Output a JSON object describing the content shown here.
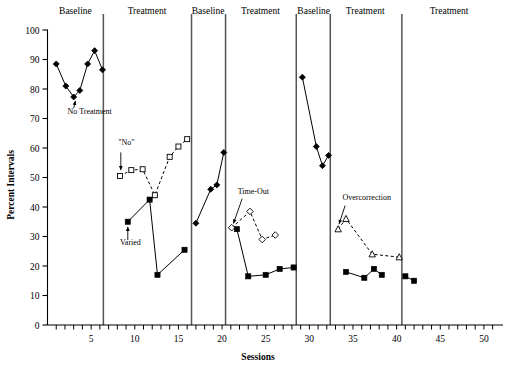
{
  "chart_data": {
    "type": "line",
    "title": "",
    "xlabel": "Sessions",
    "ylabel": "Percent Intervals",
    "xlim": [
      0,
      51.5
    ],
    "ylim": [
      0,
      100
    ],
    "grid": false,
    "legend_position": "none",
    "xticks": [
      0,
      1,
      2,
      3,
      4,
      5,
      6,
      7,
      8,
      9,
      10,
      11,
      12,
      13,
      14,
      15,
      16,
      17,
      18,
      19,
      20,
      21,
      22,
      23,
      24,
      25,
      26,
      27,
      28,
      29,
      30,
      31,
      32,
      33,
      34,
      35,
      36,
      37,
      38,
      39,
      40,
      41,
      42,
      43,
      44,
      45,
      46,
      47,
      48,
      49,
      50,
      51
    ],
    "xtick_labels": [
      {
        "v": 5,
        "text": "5"
      },
      {
        "v": 10,
        "text": "10"
      },
      {
        "v": 15,
        "text": "15"
      },
      {
        "v": 20,
        "text": "20"
      },
      {
        "v": 25,
        "text": "25"
      },
      {
        "v": 30,
        "text": "30"
      },
      {
        "v": 35,
        "text": "35"
      },
      {
        "v": 40,
        "text": "40"
      },
      {
        "v": 45,
        "text": "45"
      },
      {
        "v": 50,
        "text": "50"
      }
    ],
    "yticks": [
      0,
      10,
      20,
      30,
      40,
      50,
      60,
      70,
      80,
      90,
      100
    ],
    "ytick_labels": [
      "0",
      "10",
      "20",
      "30",
      "40",
      "50",
      "60",
      "70",
      "80",
      "90",
      "100"
    ],
    "phase_dividers": [
      6.4,
      16.5,
      20.4,
      28.5,
      32.4,
      40.6
    ],
    "phase_labels": [
      {
        "text": "Baseline",
        "x": 3.2
      },
      {
        "text": "Treatment",
        "x": 11.4
      },
      {
        "text": "Baseline",
        "x": 18.4
      },
      {
        "text": "Treatment",
        "x": 24.4
      },
      {
        "text": "Baseline",
        "x": 30.5
      },
      {
        "text": "Treatment",
        "x": 36.4
      },
      {
        "text": "Treatment",
        "x": 46.0
      }
    ],
    "series": [
      {
        "name": "No Treatment",
        "marker": "filled-diamond",
        "linestyle": "solid",
        "color": "#000000",
        "points": [
          {
            "x": 1.0,
            "y": 88.5
          },
          {
            "x": 2.1,
            "y": 81.0
          },
          {
            "x": 3.0,
            "y": 77.3
          },
          {
            "x": 3.7,
            "y": 79.5
          },
          {
            "x": 4.6,
            "y": 88.5
          },
          {
            "x": 5.4,
            "y": 93.0
          },
          {
            "x": 6.3,
            "y": 86.5
          }
        ]
      },
      {
        "name": "\"No\"",
        "marker": "open-square",
        "linestyle": "dashed",
        "color": "#000000",
        "points": [
          {
            "x": 8.3,
            "y": 50.5
          },
          {
            "x": 9.6,
            "y": 52.5
          },
          {
            "x": 10.9,
            "y": 52.8
          },
          {
            "x": 12.3,
            "y": 44.0
          },
          {
            "x": 14.0,
            "y": 57.0
          },
          {
            "x": 15.0,
            "y": 60.5
          },
          {
            "x": 16.0,
            "y": 63.0
          }
        ]
      },
      {
        "name": "Varied",
        "marker": "filled-square",
        "linestyle": "solid",
        "color": "#000000",
        "points": [
          {
            "x": 9.2,
            "y": 35.0
          },
          {
            "x": 11.7,
            "y": 42.5
          },
          {
            "x": 12.6,
            "y": 17.0
          },
          {
            "x": 15.7,
            "y": 25.5
          }
        ]
      },
      {
        "name": "Baseline 2",
        "marker": "filled-diamond",
        "linestyle": "solid",
        "color": "#000000",
        "points": [
          {
            "x": 17.0,
            "y": 34.5
          },
          {
            "x": 18.7,
            "y": 46.0
          },
          {
            "x": 19.4,
            "y": 47.5
          },
          {
            "x": 20.2,
            "y": 58.5
          }
        ]
      },
      {
        "name": "Time-Out",
        "marker": "open-diamond",
        "linestyle": "dashed",
        "color": "#000000",
        "points": [
          {
            "x": 21.1,
            "y": 33.0
          },
          {
            "x": 23.2,
            "y": 38.5
          },
          {
            "x": 24.6,
            "y": 29.0
          },
          {
            "x": 26.1,
            "y": 30.5
          }
        ]
      },
      {
        "name": "Time-Out responding",
        "marker": "filled-square",
        "linestyle": "solid",
        "color": "#000000",
        "points": [
          {
            "x": 21.7,
            "y": 32.5
          },
          {
            "x": 23.0,
            "y": 16.5
          },
          {
            "x": 25.0,
            "y": 17.0
          },
          {
            "x": 26.6,
            "y": 19.0
          },
          {
            "x": 28.2,
            "y": 19.5
          }
        ]
      },
      {
        "name": "Baseline 3",
        "marker": "filled-diamond",
        "linestyle": "solid",
        "color": "#000000",
        "points": [
          {
            "x": 29.2,
            "y": 84.0
          },
          {
            "x": 30.8,
            "y": 60.5
          },
          {
            "x": 31.5,
            "y": 54.0
          },
          {
            "x": 32.2,
            "y": 57.5
          }
        ]
      },
      {
        "name": "Overcorrection",
        "marker": "open-triangle",
        "linestyle": "dashed",
        "color": "#000000",
        "points": [
          {
            "x": 33.3,
            "y": 32.5
          },
          {
            "x": 34.2,
            "y": 36.0
          },
          {
            "x": 37.2,
            "y": 24.0
          },
          {
            "x": 40.3,
            "y": 23.0
          }
        ]
      },
      {
        "name": "Overcorrection responding",
        "marker": "filled-square",
        "linestyle": "solid",
        "color": "#000000",
        "points": [
          {
            "x": 34.2,
            "y": 18.0
          },
          {
            "x": 36.3,
            "y": 16.0
          },
          {
            "x": 37.4,
            "y": 19.0
          },
          {
            "x": 38.3,
            "y": 17.0
          }
        ]
      },
      {
        "name": "Final treatment",
        "marker": "filled-square",
        "linestyle": "solid",
        "color": "#000000",
        "points": [
          {
            "x": 41.0,
            "y": 16.5
          },
          {
            "x": 42.0,
            "y": 15.0
          }
        ]
      }
    ],
    "annotations": [
      {
        "text": "No Treatment",
        "text_x": 2.3,
        "text_y": 71.5,
        "anchor": "start",
        "arrow": {
          "x1": 3.0,
          "y1": 73.5,
          "x2": 3.2,
          "y2": 76.0
        }
      },
      {
        "text": "\"No\"",
        "text_x": 8.1,
        "text_y": 61.0,
        "anchor": "start",
        "arrow": {
          "x1": 8.4,
          "y1": 58.5,
          "x2": 8.4,
          "y2": 52.5
        }
      },
      {
        "text": "Varied",
        "text_x": 8.3,
        "text_y": 27.0,
        "anchor": "start",
        "arrow": {
          "x1": 9.2,
          "y1": 28.8,
          "x2": 9.2,
          "y2": 33.3
        }
      },
      {
        "text": "Time-Out",
        "text_x": 21.8,
        "text_y": 44.5,
        "anchor": "start",
        "arrow": {
          "x1": 22.3,
          "y1": 42.8,
          "x2": 21.3,
          "y2": 34.4
        }
      },
      {
        "text": "Overcorrection",
        "text_x": 33.8,
        "text_y": 42.5,
        "anchor": "start",
        "arrow": {
          "x1": 34.1,
          "y1": 40.5,
          "x2": 33.4,
          "y2": 34.2
        }
      }
    ]
  }
}
